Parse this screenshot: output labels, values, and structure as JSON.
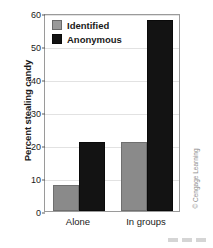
{
  "chart_data": {
    "type": "bar",
    "title": "",
    "xlabel": "",
    "ylabel": "Percent stealing candy",
    "categories": [
      "Alone",
      "In groups"
    ],
    "series": [
      {
        "name": "Identified",
        "values": [
          8,
          21
        ],
        "color": "#8a8a8a"
      },
      {
        "name": "Anonymous",
        "values": [
          21,
          58
        ],
        "color": "#131313"
      }
    ],
    "ylim": [
      0,
      60
    ],
    "yticks": [
      0,
      10,
      20,
      30,
      40,
      50,
      60
    ],
    "ytick_labels": [
      "0",
      "10",
      "20",
      "30",
      "40",
      "50",
      "60"
    ],
    "grid": true,
    "legend_position": "top-left"
  },
  "legend": {
    "items": [
      {
        "label": "Identified",
        "swatch": "gray"
      },
      {
        "label": "Anonymous",
        "swatch": "black"
      }
    ]
  },
  "credit": {
    "text": "© Cengage Learning"
  }
}
